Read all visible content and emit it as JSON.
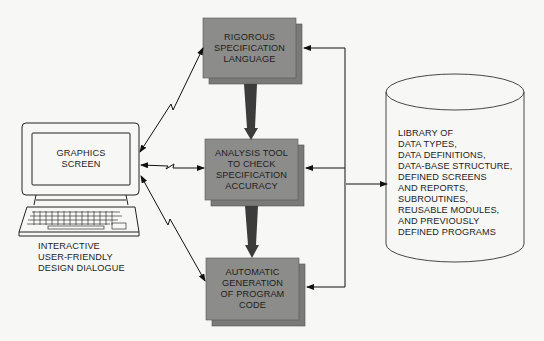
{
  "computer": {
    "screen_label": "GRAPHICS\nSCREEN",
    "caption": "INTERACTIVE\nUSER-FRIENDLY\nDESIGN DIALOGUE"
  },
  "boxes": [
    {
      "label": "RIGOROUS\nSPECIFICATION\nLANGUAGE"
    },
    {
      "label": "ANALYSIS TOOL\nTO CHECK\nSPECIFICATION\nACCURACY"
    },
    {
      "label": "AUTOMATIC\nGENERATION\nOF PROGRAM\nCODE"
    }
  ],
  "library": {
    "label": "LIBRARY OF\nDATA TYPES,\nDATA DEFINITIONS,\nDATA-BASE STRUCTURE,\nDEFINED SCREENS\nAND REPORTS,\nSUBROUTINES,\nREUSABLE MODULES,\nAND PREVIOUSLY\nDEFINED PROGRAMS"
  },
  "colors": {
    "box_fill": "#8c8c8a",
    "box_shadow": "#7a7a78",
    "flow_arrow": "#3c3c3c",
    "line": "#111111",
    "background": "#f7f7f5"
  }
}
